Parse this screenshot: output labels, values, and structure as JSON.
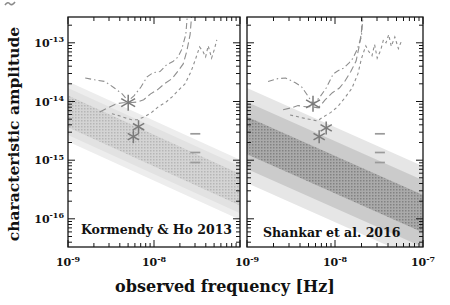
{
  "figure": {
    "xlabel": "observed frequency [Hz]",
    "ylabel": "characteristic amplitude",
    "background": "#ffffff",
    "axis_color": "#161616",
    "text_color": "#111111",
    "curve_color": "#8e8e8e",
    "star_color": "#7a7a7a",
    "limit_color": "#9a9a9a"
  },
  "chart_data": {
    "type": "line",
    "title": "",
    "xlabel": "observed frequency [Hz]",
    "ylabel": "characteristic amplitude",
    "x_scale": "log",
    "y_scale": "log",
    "x_log_range": [
      -9,
      -7
    ],
    "y_log_range": [
      -16.48,
      -12.56
    ],
    "grid": false,
    "legend": "none",
    "y_tick_labels": [
      {
        "base": "10",
        "exp": "-13",
        "log": -13
      },
      {
        "base": "10",
        "exp": "-14",
        "log": -14
      },
      {
        "base": "10",
        "exp": "-15",
        "log": -15
      },
      {
        "base": "10",
        "exp": "-16",
        "log": -16
      }
    ],
    "panels": [
      {
        "label": "Kormendy & Ho 2013",
        "x_tick_labels": [
          {
            "base": "10",
            "exp": "-9",
            "log": -9
          },
          {
            "base": "10",
            "exp": "-8",
            "log": -8
          }
        ],
        "gwb_band": {
          "center_logh_at_logf_minus9": -14.17,
          "slope_dex_per_decade": -0.667,
          "dot_color": "#b6b6b6",
          "levels": [
            {
              "half_width_dex": 0.51,
              "color": "#ededed",
              "dots": false
            },
            {
              "half_width_dex": 0.4,
              "color": "#e2e2e2",
              "dots": false
            },
            {
              "half_width_dex": 0.27,
              "color": "#d4d4d4",
              "dots": true
            }
          ]
        },
        "stars": [
          {
            "logf": -8.3,
            "logh": -14.02,
            "size": 8
          },
          {
            "logf": -8.18,
            "logh": -14.43,
            "size": 6.5
          },
          {
            "logf": -8.24,
            "logh": -14.6,
            "size": 6.5
          }
        ],
        "upper_limits": [
          {
            "logf": -7.52,
            "logh": -14.55
          },
          {
            "logf": -7.52,
            "logh": -14.87
          },
          {
            "logf": -7.52,
            "logh": -15.04
          }
        ],
        "curves": [
          {
            "name": "pta-sensitivity-dashdot",
            "style": "dashdot",
            "points": [
              [
                -8.8,
                -13.6
              ],
              [
                -8.69,
                -13.63
              ],
              [
                -8.57,
                -13.66
              ],
              [
                -8.46,
                -13.77
              ],
              [
                -8.37,
                -13.87
              ],
              [
                -8.3,
                -13.99
              ],
              [
                -8.23,
                -13.9
              ],
              [
                -8.15,
                -13.75
              ],
              [
                -8.08,
                -13.58
              ],
              [
                -8.01,
                -13.51
              ],
              [
                -7.93,
                -13.49
              ],
              [
                -7.85,
                -13.37
              ],
              [
                -7.78,
                -13.32
              ],
              [
                -7.72,
                -13.24
              ],
              [
                -7.68,
                -13.12
              ],
              [
                -7.63,
                -12.86
              ],
              [
                -7.61,
                -12.5
              ]
            ]
          },
          {
            "name": "pta-sensitivity-longdash",
            "style": "longdash",
            "points": [
              [
                -8.63,
                -14.18
              ],
              [
                -8.54,
                -14.11
              ],
              [
                -8.44,
                -14.04
              ],
              [
                -8.36,
                -14.02
              ],
              [
                -8.29,
                -14.02
              ],
              [
                -8.2,
                -14.01
              ],
              [
                -8.12,
                -13.97
              ],
              [
                -8.04,
                -13.87
              ],
              [
                -7.96,
                -13.8
              ],
              [
                -7.88,
                -13.7
              ],
              [
                -7.79,
                -13.61
              ],
              [
                -7.72,
                -13.48
              ],
              [
                -7.66,
                -13.36
              ],
              [
                -7.62,
                -13.15
              ],
              [
                -7.58,
                -12.86
              ],
              [
                -7.56,
                -12.5
              ]
            ]
          },
          {
            "name": "pta-sensitivity-shortdash",
            "style": "shortdash",
            "points": [
              [
                -8.49,
                -14.21
              ],
              [
                -8.41,
                -14.24
              ],
              [
                -8.33,
                -14.28
              ],
              [
                -8.26,
                -14.31
              ],
              [
                -8.19,
                -14.31
              ],
              [
                -8.11,
                -14.26
              ],
              [
                -8.03,
                -14.19
              ],
              [
                -7.95,
                -14.09
              ],
              [
                -7.86,
                -14.01
              ],
              [
                -7.79,
                -13.92
              ],
              [
                -7.71,
                -13.8
              ],
              [
                -7.64,
                -13.7
              ],
              [
                -7.57,
                -13.49
              ],
              [
                -7.52,
                -13.29
              ],
              [
                -7.47,
                -13.07
              ],
              [
                -7.43,
                -13.15
              ],
              [
                -7.4,
                -13.24
              ],
              [
                -7.37,
                -13.05
              ],
              [
                -7.33,
                -13.26
              ],
              [
                -7.3,
                -13.12
              ],
              [
                -7.27,
                -12.95
              ]
            ]
          }
        ]
      },
      {
        "label": "Shankar et al. 2016",
        "x_tick_labels": [
          {
            "base": "10",
            "exp": "-9",
            "log": -9
          },
          {
            "base": "10",
            "exp": "-8",
            "log": -8
          },
          {
            "base": "10",
            "exp": "-7",
            "log": -7
          }
        ],
        "gwb_band": {
          "center_logh_at_logf_minus9": -14.58,
          "slope_dex_per_decade": -0.667,
          "dot_color": "#828282",
          "levels": [
            {
              "half_width_dex": 0.81,
              "color": "#e6e6e6",
              "dots": false
            },
            {
              "half_width_dex": 0.57,
              "color": "#cbcbcb",
              "dots": false
            },
            {
              "half_width_dex": 0.32,
              "color": "#aaaaaa",
              "dots": true
            }
          ]
        },
        "stars": [
          {
            "logf": -8.25,
            "logh": -14.04,
            "size": 8
          },
          {
            "logf": -8.1,
            "logh": -14.45,
            "size": 6.5
          },
          {
            "logf": -8.18,
            "logh": -14.6,
            "size": 6.5
          }
        ],
        "upper_limits": [
          {
            "logf": -7.49,
            "logh": -14.55
          },
          {
            "logf": -7.49,
            "logh": -14.87
          },
          {
            "logf": -7.49,
            "logh": -15.04
          }
        ],
        "curves": [
          {
            "name": "pta-sensitivity-dashdot",
            "style": "dashdot",
            "points": [
              [
                -8.76,
                -13.66
              ],
              [
                -8.65,
                -13.61
              ],
              [
                -8.56,
                -13.6
              ],
              [
                -8.45,
                -13.68
              ],
              [
                -8.38,
                -13.75
              ],
              [
                -8.31,
                -13.9
              ],
              [
                -8.25,
                -14.04
              ],
              [
                -8.18,
                -13.94
              ],
              [
                -8.1,
                -13.77
              ],
              [
                -8.02,
                -13.53
              ],
              [
                -7.97,
                -13.48
              ],
              [
                -7.9,
                -13.43
              ],
              [
                -7.84,
                -13.34
              ],
              [
                -7.8,
                -13.27
              ],
              [
                -7.75,
                -13.12
              ],
              [
                -7.7,
                -12.9
              ],
              [
                -7.68,
                -12.5
              ]
            ]
          },
          {
            "name": "pta-sensitivity-longdash",
            "style": "longdash",
            "points": [
              [
                -8.59,
                -14.14
              ],
              [
                -8.5,
                -14.11
              ],
              [
                -8.42,
                -14.07
              ],
              [
                -8.33,
                -14.09
              ],
              [
                -8.26,
                -14.09
              ],
              [
                -8.19,
                -14.11
              ],
              [
                -8.11,
                -13.97
              ],
              [
                -8.03,
                -13.85
              ],
              [
                -7.95,
                -13.77
              ],
              [
                -7.89,
                -13.66
              ],
              [
                -7.82,
                -13.49
              ],
              [
                -7.76,
                -13.31
              ],
              [
                -7.73,
                -13.09
              ],
              [
                -7.7,
                -12.83
              ],
              [
                -7.69,
                -12.5
              ]
            ]
          },
          {
            "name": "pta-sensitivity-shortdash",
            "style": "shortdash",
            "points": [
              [
                -8.51,
                -14.23
              ],
              [
                -8.42,
                -14.26
              ],
              [
                -8.34,
                -14.29
              ],
              [
                -8.27,
                -14.31
              ],
              [
                -8.2,
                -14.33
              ],
              [
                -8.13,
                -14.26
              ],
              [
                -8.05,
                -14.19
              ],
              [
                -7.97,
                -14.09
              ],
              [
                -7.89,
                -13.94
              ],
              [
                -7.81,
                -13.78
              ],
              [
                -7.74,
                -13.53
              ],
              [
                -7.7,
                -13.27
              ],
              [
                -7.65,
                -13.05
              ],
              [
                -7.62,
                -13.14
              ],
              [
                -7.58,
                -13.22
              ],
              [
                -7.55,
                -13.03
              ],
              [
                -7.52,
                -13.26
              ],
              [
                -7.48,
                -13.12
              ],
              [
                -7.45,
                -12.95
              ],
              [
                -7.42,
                -13.0
              ],
              [
                -7.39,
                -12.86
              ],
              [
                -7.36,
                -13.06
              ],
              [
                -7.32,
                -12.9
              ],
              [
                -7.28,
                -13.1
              ],
              [
                -7.24,
                -12.95
              ]
            ]
          }
        ]
      }
    ]
  }
}
